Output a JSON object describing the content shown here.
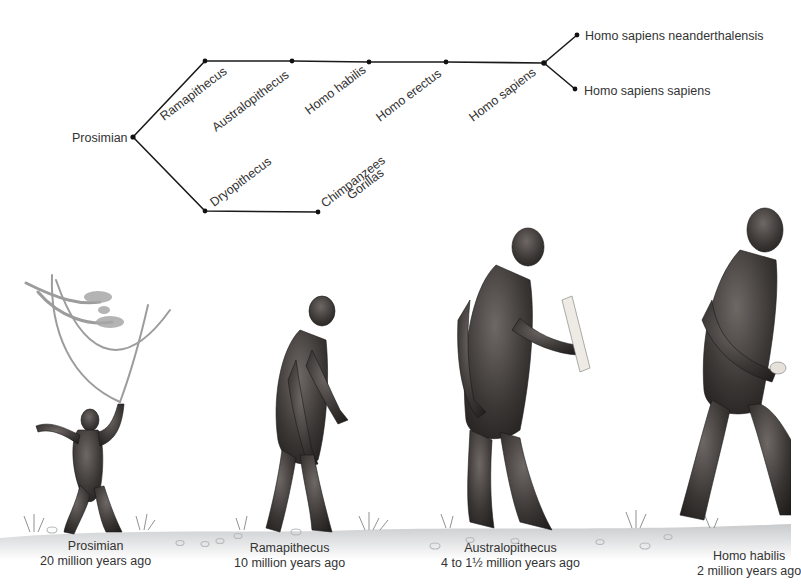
{
  "tree": {
    "root": {
      "label": "Prosimian",
      "x": 133,
      "y": 137
    },
    "upper_branch": [
      {
        "label": "Ramapithecus",
        "x": 205,
        "y": 61
      },
      {
        "label": "Australopithecus",
        "x": 292,
        "y": 61
      },
      {
        "label": "Homo habilis",
        "x": 369,
        "y": 62
      },
      {
        "label": "Homo erectus",
        "x": 446,
        "y": 62
      },
      {
        "label": "Homo sapiens",
        "x": 544,
        "y": 63
      }
    ],
    "terminal_branches": [
      {
        "label": "Homo sapiens neanderthalensis",
        "x": 577,
        "y": 35
      },
      {
        "label": "Homo sapiens sapiens",
        "x": 575,
        "y": 89
      }
    ],
    "lower_branch": [
      {
        "label": "Dryopithecus",
        "x": 205,
        "y": 211
      },
      {
        "label": "Chimpanzees",
        "label2": "Gorillas",
        "x": 318,
        "y": 212
      }
    ]
  },
  "figures": [
    {
      "name": "Prosimian",
      "age": "20 million years ago"
    },
    {
      "name": "Ramapithecus",
      "age": "10 million years ago"
    },
    {
      "name": "Australopithecus",
      "age": "4 to 1½ million years ago"
    },
    {
      "name": "Homo habilis",
      "age": "2 million years ago"
    }
  ],
  "colors": {
    "line": "#1a1a1a",
    "fur_dark": "#2e2b2a",
    "fur_mid": "#5a5552",
    "ground": "#d9dadb",
    "branch": "#a9a9a9"
  }
}
